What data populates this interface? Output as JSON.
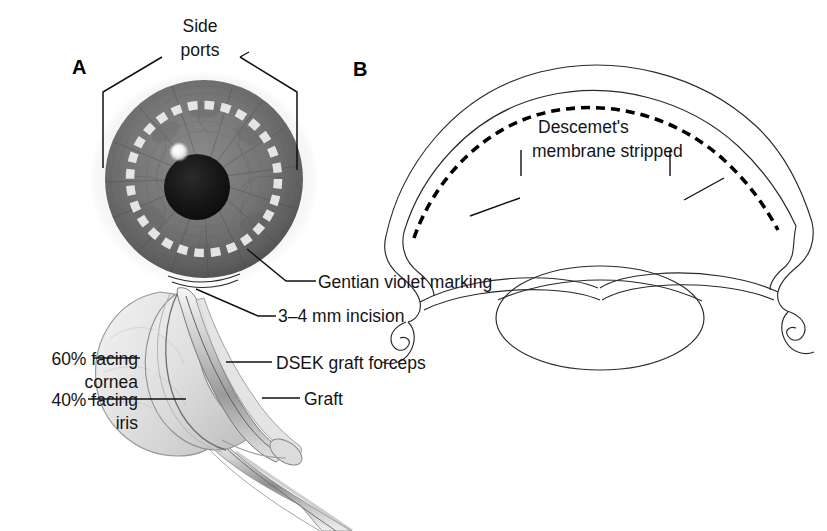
{
  "figure": {
    "background_color": "#ffffff",
    "ink_color": "#111111"
  },
  "panels": [
    {
      "id": "A",
      "letter": "A",
      "description": "Surgeon's view of eye with gentian violet marking and folded graft in forceps"
    },
    {
      "id": "B",
      "letter": "B",
      "description": "Cross-section of anterior eye showing stripped Descemet's membrane"
    }
  ],
  "labels": {
    "side_ports_line1": "Side",
    "side_ports_line2": "ports",
    "gentian_violet": "Gentian violet marking",
    "incision": "3–4 mm incision",
    "facing_cornea_line1": "60% facing",
    "facing_cornea_line2": "cornea",
    "facing_iris_line1": "40% facing",
    "facing_iris_line2": "iris",
    "forceps": "DSEK graft forceps",
    "graft": "Graft",
    "descemets_line1": "Descemet's",
    "descemets_line2": "membrane stripped"
  },
  "eye_front": {
    "center_x": 204,
    "center_y": 179,
    "iris_radius": 99,
    "pupil_center_x": 197,
    "pupil_center_y": 187,
    "pupil_radius": 33,
    "highlight_x": 179,
    "highlight_y": 152,
    "highlight_radius": 8,
    "marking_ring_radius": 74,
    "marking_dash_count": 28,
    "iris_color": "#6f6f6f",
    "pupil_color": "#121212",
    "marking_color": "#e8e8e4",
    "sclera_color": "#efefef"
  },
  "colors": {
    "ink": "#111111",
    "line": "#2a2a2a",
    "graft_fill": "#e9e9e9",
    "graft_shade": "#cfcfcf",
    "forceps_fill": "#dcdcdc",
    "highlight": "#ffffff"
  }
}
